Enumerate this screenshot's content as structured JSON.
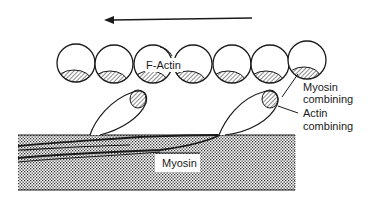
{
  "diagram": {
    "type": "actin-myosin cross-bridge schematic",
    "direction_arrow": {
      "direction": "left"
    },
    "labels": {
      "f_actin": "F-Actin",
      "myosin": "Myosin",
      "myosin_combining_1": "Myosin",
      "myosin_combining_2": "combining",
      "actin_combining_1": "Actin",
      "actin_combining_2": "combining"
    },
    "actin_monomers": 7,
    "myosin_heads": 2,
    "colors": {
      "ink": "#1a1a1a",
      "background": "#ffffff",
      "stipple": "#555555"
    }
  }
}
